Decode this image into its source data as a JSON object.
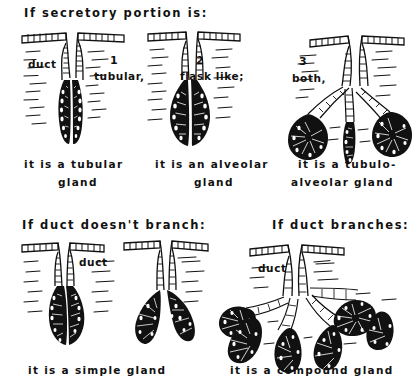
{
  "figure": {
    "title_top": "If secretory portion is:",
    "title_bottom_left": "If duct doesn't branch:",
    "title_bottom_right": "If duct branches:",
    "ink_color": "#111111",
    "background_color": "#ffffff"
  },
  "top_row": {
    "heading": "If secretory portion is:",
    "items": [
      {
        "number": "1",
        "type_label": "tubular,",
        "duct_label": "duct",
        "caption_line1": "it is a tubular",
        "caption_line2": "gland",
        "secretory_shape": "straight-tube"
      },
      {
        "number": "2",
        "type_label": "flask like;",
        "duct_label": "",
        "caption_line1": "it is an alveolar",
        "caption_line2": "gland",
        "secretory_shape": "flask-bulb"
      },
      {
        "number": "3",
        "type_label": "both,",
        "duct_label": "",
        "caption_line1": "it is a tubulo-",
        "caption_line2": "alveolar gland",
        "secretory_shape": "mixed-branched"
      }
    ]
  },
  "bottom_row": {
    "items": [
      {
        "heading": "If duct doesn't branch:",
        "duct_label": "duct",
        "caption": "it is a simple gland",
        "duct_shape": "unbranched"
      },
      {
        "heading": "If duct branches:",
        "duct_label": "duct",
        "caption": "it is a compound gland",
        "duct_shape": "branched"
      }
    ]
  }
}
